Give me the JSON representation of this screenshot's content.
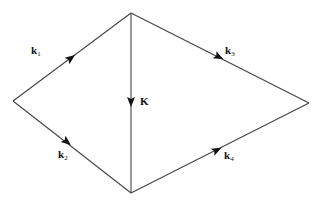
{
  "diagram": {
    "type": "feynman-box-momentum-diagram",
    "vertices": {
      "left": [
        13,
        101
      ],
      "top": [
        131,
        13
      ],
      "bottom": [
        131,
        193
      ],
      "right": [
        309,
        103
      ]
    },
    "edges": [
      {
        "id": "k1",
        "from": "left",
        "to": "top",
        "label_main": "k",
        "label_sub": "1"
      },
      {
        "id": "k2",
        "from": "left",
        "to": "bottom",
        "label_main": "k",
        "label_sub": "2"
      },
      {
        "id": "K",
        "from": "top",
        "to": "bottom",
        "label_main": "K",
        "label_sub": ""
      },
      {
        "id": "k3",
        "from": "top",
        "to": "right",
        "label_main": "k",
        "label_sub": "3"
      },
      {
        "id": "k4",
        "from": "bottom",
        "to": "right",
        "label_main": "k",
        "label_sub": "4"
      }
    ],
    "colors": {
      "line": "#444444",
      "arrow": "#111111",
      "text": "#111111",
      "background": "#ffffff"
    }
  }
}
